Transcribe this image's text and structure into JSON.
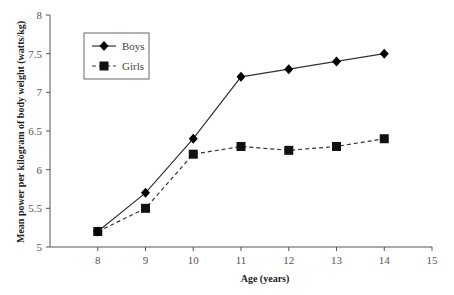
{
  "chart_data": {
    "type": "line",
    "title": "",
    "xlabel": "Age (years)",
    "ylabel": "Mean power per kilogram of body weight (watts/kg)",
    "xlim": [
      7,
      15
    ],
    "ylim": [
      5,
      8
    ],
    "x_ticks": [
      8,
      9,
      10,
      11,
      12,
      13,
      14,
      15
    ],
    "y_ticks": [
      5,
      5.5,
      6,
      6.5,
      7,
      7.5,
      8
    ],
    "y_tick_labels": [
      "5",
      "5.5",
      "6",
      "6.5",
      "7",
      "7.5",
      "8"
    ],
    "grid": false,
    "legend_position": "upper-left",
    "x": [
      8,
      9,
      10,
      11,
      12,
      13,
      14
    ],
    "series": [
      {
        "name": "Boys",
        "marker": "diamond",
        "line": "solid",
        "color": "#000000",
        "values": [
          5.2,
          5.7,
          6.4,
          7.2,
          7.3,
          7.4,
          7.5
        ]
      },
      {
        "name": "Girls",
        "marker": "square",
        "line": "dashed",
        "color": "#000000",
        "values": [
          5.2,
          5.5,
          6.2,
          6.3,
          6.25,
          6.3,
          6.4
        ]
      }
    ]
  }
}
